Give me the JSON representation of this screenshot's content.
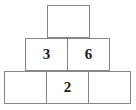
{
  "figure": {
    "kind": "number-pyramid",
    "border_color": "#868686",
    "text_color": "#1c1c1c",
    "background_color": "#ffffff",
    "rows": [
      {
        "name": "top-row",
        "cells": [
          {
            "name": "cell-top-1",
            "value": "",
            "filled": false
          }
        ]
      },
      {
        "name": "middle-row",
        "cells": [
          {
            "name": "cell-middle-1",
            "value": "3",
            "filled": true
          },
          {
            "name": "cell-middle-2",
            "value": "6",
            "filled": true
          }
        ]
      },
      {
        "name": "bottom-row",
        "cells": [
          {
            "name": "cell-bottom-1",
            "value": "",
            "filled": false
          },
          {
            "name": "cell-bottom-2",
            "value": "2",
            "filled": true
          },
          {
            "name": "cell-bottom-3",
            "value": "",
            "filled": false
          }
        ]
      }
    ]
  }
}
